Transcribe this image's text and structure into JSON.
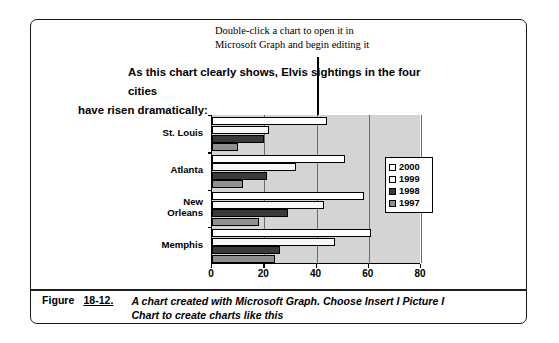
{
  "callout": {
    "line1": "Double-click a chart to open it in",
    "line2": "Microsoft Graph and begin editing it"
  },
  "heading": {
    "line1": "As this chart clearly shows, Elvis sightings in the four cities",
    "line2": "have risen dramatically:"
  },
  "caption": {
    "figure_label": "Figure",
    "figure_number": "18-12.",
    "text": "A chart created with Microsoft Graph. Choose Insert I Picture I Chart to create charts like this"
  },
  "chart_data": {
    "type": "bar",
    "orientation": "horizontal",
    "title": "",
    "xlabel": "",
    "ylabel": "",
    "categories": [
      "St. Louis",
      "Atlanta",
      "New Orleans",
      "Memphis"
    ],
    "series": [
      {
        "name": "2000",
        "color": "#ffffff",
        "values": [
          44,
          51,
          58,
          61
        ]
      },
      {
        "name": "1999",
        "color": "#f7f7f7",
        "values": [
          22,
          32,
          43,
          47
        ]
      },
      {
        "name": "1998",
        "color": "#3a3a3a",
        "values": [
          20,
          21,
          29,
          26
        ]
      },
      {
        "name": "1997",
        "color": "#8f8f8f",
        "values": [
          10,
          12,
          18,
          24
        ]
      }
    ],
    "xlim": [
      0,
      80
    ],
    "xticks": [
      0,
      20,
      40,
      60,
      80
    ],
    "xticklabels": [
      "0",
      "20",
      "40",
      "60",
      "80"
    ],
    "grid": true,
    "legend_position": "right",
    "plot_background": "#d4d4d4"
  }
}
